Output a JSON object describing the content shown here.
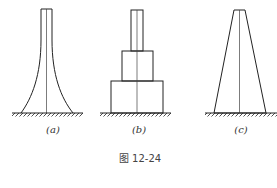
{
  "figure": {
    "caption": "图 12-24",
    "panels": [
      {
        "id": "a",
        "label": "(a)",
        "shape": "concave-flared column (thin top, curved flare to wide base)"
      },
      {
        "id": "b",
        "label": "(b)",
        "shape": "stepped column (three stacked rectangular blocks)"
      },
      {
        "id": "c",
        "label": "(c)",
        "shape": "tapered column (trapezoid, straight sides)"
      }
    ],
    "colors": {
      "stroke": "#222222",
      "text": "#333333",
      "background": "#ffffff"
    }
  }
}
